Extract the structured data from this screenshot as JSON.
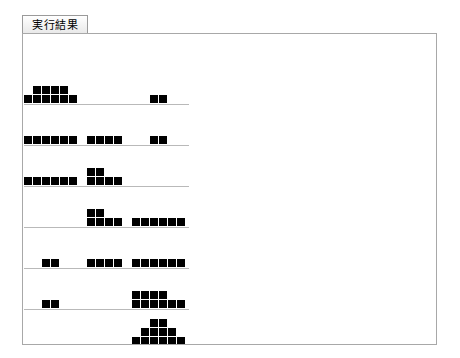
{
  "window": {
    "title": "実行結果"
  },
  "tabs": [
    {
      "label": "実行結果",
      "selected": true,
      "name": "tab-execution-result"
    }
  ],
  "panel": {
    "name": "execution-result-panel",
    "background_color": "#ffffff",
    "border_color": "#a8a8a8"
  },
  "chart_data": {
    "type": "bar",
    "title": "",
    "subtitle": "",
    "xlabel": "",
    "ylabel": "",
    "grid": false,
    "legend": null,
    "glyph": "■",
    "glyph_color": "#000000",
    "baseline_color": "#b9b9b9",
    "block_px": 8,
    "column_pitch_px": 9,
    "level_pitch_px": 9,
    "row_count": 7,
    "column_count": 18,
    "rows": [
      {
        "index": 0,
        "baseline_y": 70,
        "baseline_x": 0,
        "baseline_width": 165,
        "categories": [
          0,
          1,
          2,
          3,
          4,
          5,
          14,
          15
        ],
        "values": [
          1,
          2,
          2,
          2,
          2,
          1,
          1,
          1
        ]
      },
      {
        "index": 1,
        "baseline_y": 111,
        "baseline_x": 0,
        "baseline_width": 165,
        "categories": [
          0,
          1,
          2,
          3,
          4,
          5,
          7,
          8,
          9,
          10,
          14,
          15
        ],
        "values": [
          1,
          1,
          1,
          1,
          1,
          1,
          1,
          1,
          1,
          1,
          1,
          1
        ]
      },
      {
        "index": 2,
        "baseline_y": 152,
        "baseline_x": 0,
        "baseline_width": 165,
        "categories": [
          0,
          1,
          2,
          3,
          4,
          5,
          7,
          8,
          9,
          10
        ],
        "values": [
          1,
          1,
          1,
          1,
          1,
          1,
          2,
          2,
          1,
          1
        ]
      },
      {
        "index": 3,
        "baseline_y": 193,
        "baseline_x": 0,
        "baseline_width": 165,
        "categories": [
          7,
          8,
          9,
          10,
          12,
          13,
          14,
          15,
          16,
          17
        ],
        "values": [
          2,
          2,
          1,
          1,
          1,
          1,
          1,
          1,
          1,
          1
        ]
      },
      {
        "index": 4,
        "baseline_y": 234,
        "baseline_x": 0,
        "baseline_width": 165,
        "categories": [
          2,
          3,
          7,
          8,
          9,
          10,
          12,
          13,
          14,
          15,
          16,
          17
        ],
        "values": [
          1,
          1,
          1,
          1,
          1,
          1,
          1,
          1,
          1,
          1,
          1,
          1
        ]
      },
      {
        "index": 5,
        "baseline_y": 275,
        "baseline_x": 0,
        "baseline_width": 165,
        "categories": [
          2,
          3,
          12,
          13,
          14,
          15,
          16,
          17
        ],
        "values": [
          1,
          1,
          2,
          2,
          2,
          2,
          1,
          1
        ]
      },
      {
        "index": 6,
        "baseline_y": 312,
        "baseline_x": 0,
        "baseline_width": 165,
        "categories": [
          12,
          13,
          14,
          15,
          16,
          17
        ],
        "values": [
          1,
          2,
          3,
          3,
          2,
          1
        ]
      }
    ]
  }
}
